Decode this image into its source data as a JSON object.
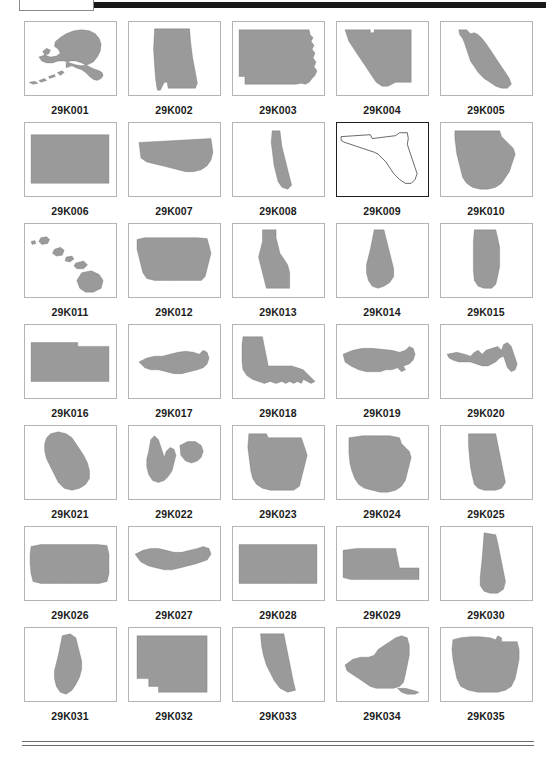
{
  "page": {
    "columns": 5,
    "rows": 7,
    "fill_color": "#9a9a9a",
    "outline_color": "#222222",
    "border_color": "#b4b4b4",
    "rule_color": "#181818",
    "background": "#ffffff"
  },
  "header": {
    "tab_label": "",
    "rule_label": "header-rule"
  },
  "footer": {
    "rule_top_label": "footer-rule-top",
    "rule_bottom_label": "footer-rule-bottom"
  },
  "grid": {
    "rows": [
      [
        {
          "code": "29K001",
          "state": "Alaska",
          "style": "filled"
        },
        {
          "code": "29K002",
          "state": "Alabama",
          "style": "filled"
        },
        {
          "code": "29K003",
          "state": "Arkansas",
          "style": "filled"
        },
        {
          "code": "29K004",
          "state": "Arizona",
          "style": "filled"
        },
        {
          "code": "29K005",
          "state": "California",
          "style": "filled"
        }
      ],
      [
        {
          "code": "29K006",
          "state": "Colorado",
          "style": "filled"
        },
        {
          "code": "29K007",
          "state": "Connecticut",
          "style": "filled"
        },
        {
          "code": "29K008",
          "state": "Delaware",
          "style": "filled"
        },
        {
          "code": "29K009",
          "state": "Florida",
          "style": "outline"
        },
        {
          "code": "29K010",
          "state": "Georgia",
          "style": "filled"
        }
      ],
      [
        {
          "code": "29K011",
          "state": "Hawaii",
          "style": "filled"
        },
        {
          "code": "29K012",
          "state": "Iowa",
          "style": "filled"
        },
        {
          "code": "29K013",
          "state": "Idaho",
          "style": "filled"
        },
        {
          "code": "29K014",
          "state": "Illinois",
          "style": "filled"
        },
        {
          "code": "29K015",
          "state": "Indiana",
          "style": "filled"
        }
      ],
      [
        {
          "code": "29K016",
          "state": "Kansas",
          "style": "filled"
        },
        {
          "code": "29K017",
          "state": "Kentucky",
          "style": "filled"
        },
        {
          "code": "29K018",
          "state": "Louisiana",
          "style": "filled"
        },
        {
          "code": "29K019",
          "state": "Massachusetts",
          "style": "filled"
        },
        {
          "code": "29K020",
          "state": "Maryland",
          "style": "filled"
        }
      ],
      [
        {
          "code": "29K021",
          "state": "Maine",
          "style": "filled"
        },
        {
          "code": "29K022",
          "state": "Michigan",
          "style": "filled"
        },
        {
          "code": "29K023",
          "state": "Minnesota",
          "style": "filled"
        },
        {
          "code": "29K024",
          "state": "Missouri",
          "style": "filled"
        },
        {
          "code": "29K025",
          "state": "Mississippi",
          "style": "filled"
        }
      ],
      [
        {
          "code": "29K026",
          "state": "Montana",
          "style": "filled"
        },
        {
          "code": "29K027",
          "state": "North Carolina",
          "style": "filled"
        },
        {
          "code": "29K028",
          "state": "North Dakota",
          "style": "filled"
        },
        {
          "code": "29K029",
          "state": "Nebraska",
          "style": "filled"
        },
        {
          "code": "29K030",
          "state": "New Hampshire",
          "style": "filled"
        }
      ],
      [
        {
          "code": "29K031",
          "state": "New Jersey",
          "style": "filled"
        },
        {
          "code": "29K032",
          "state": "New Mexico",
          "style": "filled"
        },
        {
          "code": "29K033",
          "state": "Nevada",
          "style": "filled"
        },
        {
          "code": "29K034",
          "state": "New York",
          "style": "filled"
        },
        {
          "code": "29K035",
          "state": "Ohio",
          "style": "filled"
        }
      ]
    ]
  },
  "shapes": {
    "29K001": "M4,62 L10,61 L13,63 L8,64 Z M14,60 L20,58 L22,60 L16,62 Z M24,56 L30,54 L31,56 L25,58 Z M33,52 L38,50 L40,52 L36,55 Z M42,47 L48,45 L52,47 L58,49 L62,52 L66,56 L70,59 L74,60 L78,58 L80,55 L79,52 L76,50 L70,48 L64,45 L58,42 L52,40 L46,40 L42,42 Z M18,30 L22,27 L26,29 L24,33 L20,34 Z M14,36 L20,34 L26,36 L32,35 L36,32 L34,28 L30,25 L31,20 L36,16 L42,12 L50,9 L58,8 L66,9 L72,12 L76,17 L78,23 L77,30 L74,36 L70,41 L64,44 L58,45 L52,44 L46,42 L40,40 L34,40 L28,42 L22,42 L17,40 Z",
    "29K002": "M26,7 L62,7 L63,20 L65,36 L68,52 L70,63 L68,68 L60,68 L52,68 L44,68 L40,68 L39,62 L36,62 L34,66 L32,70 L29,70 L28,65 L27,58 L26,44 L25,28 Z",
    "29K003": "M6,8 L78,8 L79,13 L82,16 L80,20 L83,24 L81,28 L84,32 L82,37 L85,41 L83,46 L86,50 L84,55 L81,58 L78,62 L74,64 L70,63 L64,64 L58,64 L50,64 L42,64 L34,64 L26,64 L18,64 L12,64 L12,56 L6,56 Z",
    "29K004": "M8,8 L34,8 L34,11 L38,11 L38,8 L76,8 L76,62 L60,62 L52,66 L46,66 L40,62 L36,56 L32,50 L28,44 L24,38 L20,32 L16,26 L12,20 L10,14 Z",
    "29K005": "M18,8 L26,8 L30,12 L34,11 L38,13 L42,17 L46,22 L50,28 L54,34 L58,40 L62,46 L66,52 L70,58 L72,64 L68,68 L62,68 L56,66 L50,62 L44,58 L38,52 L34,46 L30,40 L28,34 L26,28 L24,22 L22,17 L19,13 Z",
    "29K006": "M6,12 L86,12 L86,62 L6,62 Z",
    "29K007": "M10,20 L84,16 L86,30 L84,38 L80,44 L74,48 L66,50 L58,50 L50,48 L42,46 L34,44 L26,42 L18,40 L12,36 Z",
    "29K008": "M40,8 L48,8 L49,16 L50,24 L52,32 L54,40 L56,48 L58,56 L60,64 L56,68 L50,66 L46,60 L44,52 L42,44 L41,36 L40,28 L39,20 Z",
    "29K009": "M4,14 L34,12 L36,16 L44,15 L52,14 L60,13 L64,10 L72,10 L73,16 L72,22 L74,28 L76,34 L78,40 L80,46 L82,52 L80,58 L76,62 L70,62 L64,58 L58,52 L54,46 L50,40 L46,36 L42,32 L38,30 L32,28 L26,26 L20,24 L14,22 L8,20 L4,18 Z",
    "29K010": "M14,8 L60,8 L62,14 L66,18 L70,22 L74,26 L76,32 L74,38 L72,44 L70,50 L66,56 L62,62 L56,66 L48,68 L40,68 L32,66 L26,62 L22,56 L20,48 L18,40 L16,32 L15,24 L14,16 Z",
    "29K011": "M6,18 L10,17 L11,20 L7,21 Z M16,14 L22,13 L25,16 L23,20 L17,21 L14,18 Z M30,26 L36,24 L40,27 L38,32 L32,33 L28,30 Z M42,34 L48,33 L50,36 L46,39 L41,38 Z M52,40 L60,38 L64,42 L60,46 L53,46 L50,43 Z M58,50 L68,48 L76,52 L80,58 L78,66 L70,70 L62,70 L56,66 L53,58 Z",
    "29K012": "M8,16 L16,14 L24,14 L34,14 L46,14 L58,14 L70,14 L80,15 L82,22 L84,30 L82,38 L80,46 L78,54 L74,58 L66,58 L58,58 L50,58 L42,58 L34,58 L26,58 L18,56 L14,50 L12,42 L10,34 L8,26 Z",
    "29K013": "M30,6 L44,6 L44,14 L46,22 L48,30 L52,36 L56,42 L58,50 L58,58 L58,66 L34,66 L32,58 L30,50 L28,42 L26,34 L28,26 L30,18 Z",
    "29K014": "M38,6 L48,6 L50,14 L52,22 L54,30 L56,38 L58,46 L58,54 L54,60 L48,64 L42,66 L36,64 L32,58 L30,50 L30,42 L32,34 L34,26 L36,16 Z",
    "29K015": "M34,6 L56,6 L58,14 L60,24 L60,34 L60,44 L58,54 L56,62 L52,66 L44,66 L38,64 L34,58 L33,48 L33,38 L33,28 L33,18 Z",
    "29K016": "M6,18 L54,18 L54,22 L86,22 L86,58 L6,58 Z",
    "29K017": "M10,38 L18,34 L26,32 L34,32 L42,30 L50,28 L58,27 L66,28 L72,30 L76,26 L80,28 L82,34 L80,40 L76,44 L70,46 L62,48 L54,50 L46,50 L38,48 L30,46 L22,46 L16,44 Z",
    "29K018": "M10,12 L30,12 L32,22 L34,32 L36,42 L44,42 L52,42 L60,42 L66,44 L72,46 L76,50 L80,54 L84,58 L80,60 L76,58 L72,56 L70,60 L66,58 L62,60 L58,58 L54,60 L50,58 L44,60 L38,58 L32,60 L26,58 L20,56 L14,52 L10,46 L9,38 L9,28 L9,20 Z",
    "29K019": "M6,30 L16,26 L26,24 L36,24 L46,25 L56,26 L64,28 L70,26 L74,22 L78,24 L80,30 L78,36 L74,40 L68,42 L70,46 L66,48 L62,44 L56,46 L50,46 L44,48 L38,48 L30,48 L22,46 L14,42 L8,38 Z",
    "29K020": "M6,30 L16,28 L24,30 L30,32 L34,28 L38,26 L42,30 L46,26 L52,24 L58,22 L62,26 L64,20 L68,18 L72,22 L74,28 L76,34 L78,40 L76,46 L72,48 L68,44 L66,38 L64,32 L60,34 L56,38 L52,40 L48,42 L42,42 L36,40 L30,38 L24,38 L18,38 L12,36 L8,34 Z",
    "29K021": "M26,8 L34,6 L42,8 L48,12 L52,18 L56,24 L60,30 L64,38 L66,46 L66,54 L62,60 L56,64 L48,66 L40,64 L34,58 L30,50 L26,42 L22,34 L20,26 L20,18 L22,12 Z",
    "29K022": "M22,14 L26,10 L30,14 L32,20 L34,26 L36,32 L38,26 L42,22 L46,24 L48,30 L46,38 L44,46 L40,52 L36,56 L30,58 L24,56 L20,50 L18,42 L18,34 L20,26 L21,20 Z M52,20 L60,16 L68,16 L74,20 L76,26 L74,32 L70,36 L64,38 L58,36 L53,30 Z",
    "29K023": "M16,8 L34,8 L36,12 L46,12 L58,12 L70,12 L72,18 L74,24 L76,30 L74,38 L72,46 L70,54 L68,62 L62,66 L54,66 L46,66 L38,66 L30,64 L24,60 L20,54 L18,46 L17,38 L16,30 L15,22 Z",
    "29K024": "M12,12 L26,10 L40,10 L54,10 L64,12 L66,18 L70,22 L74,26 L76,32 L74,40 L72,48 L70,56 L66,62 L60,66 L52,68 L44,68 L36,66 L28,64 L22,60 L18,54 L15,46 L13,38 L12,28 Z",
    "29K025": "M28,8 L56,8 L58,18 L60,28 L62,38 L64,48 L66,58 L62,64 L56,66 L50,66 L44,66 L38,64 L34,60 L32,52 L30,42 L29,32 L28,20 Z",
    "29K026": "M6,20 L16,18 L26,18 L38,18 L50,18 L62,18 L74,18 L84,19 L86,28 L86,38 L86,48 L84,56 L76,58 L66,58 L56,58 L46,58 L36,58 L26,58 L16,58 L8,56 L6,48 L5,38 L5,28 Z",
    "29K027": "M6,28 L14,24 L22,22 L30,22 L38,24 L46,26 L54,26 L62,24 L70,22 L76,20 L82,22 L84,28 L80,34 L74,36 L68,38 L60,40 L52,42 L44,44 L36,44 L28,42 L20,40 L12,36 Z",
    "29K028": "M6,18 L86,18 L86,58 L58,58 L40,58 L20,58 L6,58 Z",
    "29K029": "M6,24 L20,22 L34,22 L48,22 L60,22 L62,32 L64,42 L70,42 L78,42 L84,42 L84,54 L70,54 L56,54 L42,54 L28,54 L14,54 L6,52 Z",
    "29K030": "M44,6 L56,8 L58,16 L60,26 L62,36 L64,46 L66,56 L64,64 L58,68 L50,68 L44,66 L40,60 L40,52 L41,42 L42,32 L43,20 Z",
    "29K031": "M38,8 L46,6 L52,10 L54,18 L56,26 L58,34 L58,42 L56,50 L52,58 L48,64 L42,68 L36,66 L32,60 L30,52 L30,44 L32,36 L34,28 L36,18 Z",
    "29K032": "M8,8 L80,8 L80,58 L80,66 L62,66 L44,66 L30,66 L30,60 L20,60 L20,52 L8,52 Z",
    "29K033": "M28,6 L52,6 L54,16 L56,26 L58,36 L60,46 L62,56 L64,64 L56,66 L48,62 L42,54 L38,46 L34,38 L31,28 L29,18 Z",
    "29K034": "M8,38 L16,32 L24,30 L32,30 L38,28 L42,22 L48,18 L54,14 L60,10 L66,8 L72,10 L74,18 L74,28 L72,38 L70,48 L68,56 L64,60 L58,62 L52,62 L46,62 L40,62 L34,60 L28,56 L22,52 L16,48 L10,44 Z M62,62 L70,62 L78,64 L84,66 L80,68 L72,68 L66,66 Z",
    "29K035": "M12,12 L20,10 L30,9 L40,9 L50,10 L56,12 L58,8 L62,10 L62,14 L70,14 L78,14 L80,22 L80,32 L78,42 L76,52 L72,60 L66,64 L58,66 L48,66 L38,66 L28,64 L20,60 L16,52 L14,42 L12,32 L11,22 Z"
  }
}
